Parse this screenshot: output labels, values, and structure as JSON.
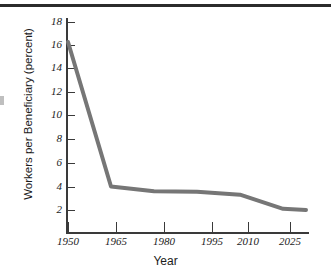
{
  "chart_data": {
    "type": "line",
    "title": "",
    "xlabel": "Year",
    "ylabel": "Workers per Beneficiary (percent)",
    "xlim": [
      1950,
      2033
    ],
    "ylim": [
      0,
      18
    ],
    "grid": false,
    "legend": "none",
    "x_ticks": [
      "1950",
      "1965",
      "1980",
      "1995",
      "2010",
      "2025"
    ],
    "y_ticks": [
      "2",
      "4",
      "6",
      "8",
      "10",
      "12",
      "14",
      "16",
      "18"
    ],
    "series": [
      {
        "name": "Workers per Beneficiary",
        "color": "#767676",
        "x": [
          1950,
          1965,
          1980,
          1995,
          2010,
          2025,
          2033
        ],
        "values": [
          16.3,
          4.0,
          3.6,
          3.55,
          3.3,
          2.1,
          2.0
        ]
      }
    ]
  },
  "axes": {
    "x_title": "Year",
    "y_title": "Workers per Beneficiary (percent)",
    "y_tick_labels": [
      "18",
      "16",
      "14",
      "12",
      "10",
      "8",
      "6",
      "4",
      "2"
    ],
    "x_tick_labels": [
      "1950",
      "1965",
      "1980",
      "1995",
      "2010",
      "2025"
    ]
  },
  "style": {
    "line_color": "#767676",
    "axis_color": "#3a3a3a",
    "rule_color": "#2b2b2b",
    "text_color": "#1c1c1c",
    "background": "#ffffff"
  }
}
